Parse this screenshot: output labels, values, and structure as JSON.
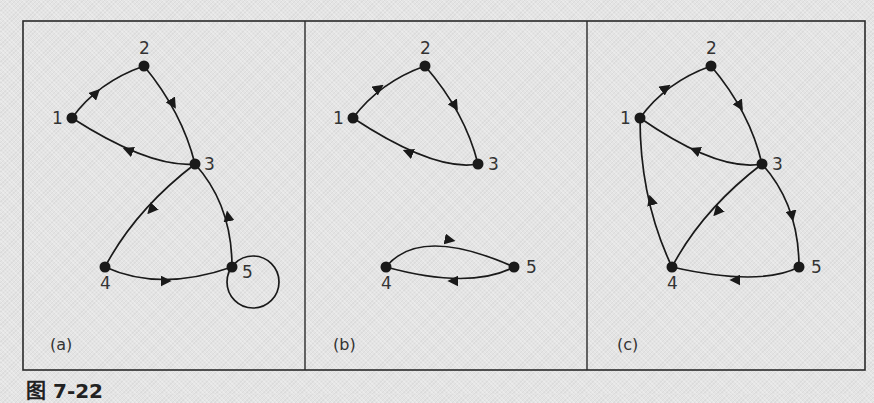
{
  "figure": {
    "caption": "图 7-22",
    "panels": [
      {
        "id": "a",
        "label": "(a)",
        "nodes": [
          {
            "id": "1",
            "label": "1",
            "x": 72,
            "y": 118,
            "label_dx": -20,
            "label_dy": 6
          },
          {
            "id": "2",
            "label": "2",
            "x": 144,
            "y": 66,
            "label_dx": -5,
            "label_dy": -12
          },
          {
            "id": "3",
            "label": "3",
            "x": 195,
            "y": 164,
            "label_dx": 9,
            "label_dy": 6
          },
          {
            "id": "4",
            "label": "4",
            "x": 105,
            "y": 267,
            "label_dx": -5,
            "label_dy": 22
          },
          {
            "id": "5",
            "label": "5",
            "x": 232,
            "y": 267,
            "label_dx": 10,
            "label_dy": 11
          }
        ],
        "edges": [
          {
            "from": "1",
            "to": "2"
          },
          {
            "from": "2",
            "to": "3"
          },
          {
            "from": "3",
            "to": "1"
          },
          {
            "from": "3",
            "to": "4"
          },
          {
            "from": "4",
            "to": "5"
          },
          {
            "from": "5",
            "to": "3"
          },
          {
            "from": "5",
            "to": "5",
            "type": "self-loop"
          }
        ]
      },
      {
        "id": "b",
        "label": "(b)",
        "nodes": [
          {
            "id": "1",
            "label": "1",
            "x": 353,
            "y": 118,
            "label_dx": -20,
            "label_dy": 6
          },
          {
            "id": "2",
            "label": "2",
            "x": 425,
            "y": 66,
            "label_dx": -5,
            "label_dy": -12
          },
          {
            "id": "3",
            "label": "3",
            "x": 478,
            "y": 164,
            "label_dx": 10,
            "label_dy": 6
          },
          {
            "id": "4",
            "label": "4",
            "x": 386,
            "y": 267,
            "label_dx": -5,
            "label_dy": 22
          },
          {
            "id": "5",
            "label": "5",
            "x": 514,
            "y": 267,
            "label_dx": 12,
            "label_dy": 6
          }
        ],
        "edges": [
          {
            "from": "1",
            "to": "2"
          },
          {
            "from": "2",
            "to": "3"
          },
          {
            "from": "3",
            "to": "1"
          },
          {
            "from": "4",
            "to": "5"
          },
          {
            "from": "5",
            "to": "4"
          }
        ]
      },
      {
        "id": "c",
        "label": "(c)",
        "nodes": [
          {
            "id": "1",
            "label": "1",
            "x": 640,
            "y": 118,
            "label_dx": -20,
            "label_dy": 6
          },
          {
            "id": "2",
            "label": "2",
            "x": 711,
            "y": 66,
            "label_dx": -5,
            "label_dy": -12
          },
          {
            "id": "3",
            "label": "3",
            "x": 762,
            "y": 164,
            "label_dx": 10,
            "label_dy": 6
          },
          {
            "id": "4",
            "label": "4",
            "x": 672,
            "y": 267,
            "label_dx": -5,
            "label_dy": 22
          },
          {
            "id": "5",
            "label": "5",
            "x": 799,
            "y": 267,
            "label_dx": 12,
            "label_dy": 6
          }
        ],
        "edges": [
          {
            "from": "1",
            "to": "2"
          },
          {
            "from": "2",
            "to": "3"
          },
          {
            "from": "3",
            "to": "1"
          },
          {
            "from": "3",
            "to": "4"
          },
          {
            "from": "3",
            "to": "5"
          },
          {
            "from": "5",
            "to": "4"
          },
          {
            "from": "4",
            "to": "1"
          }
        ]
      }
    ]
  },
  "colors": {
    "line": "#1a1a1a",
    "frame": "#2a2a2a",
    "background": "#e4e4e4",
    "text": "#333333"
  }
}
